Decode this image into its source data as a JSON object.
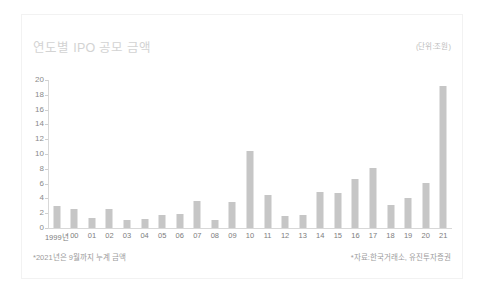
{
  "chart_data": {
    "type": "bar",
    "title": "연도별 IPO 공모 금액",
    "unit_label": "(단위:조원)",
    "xlabel": "",
    "ylabel": "",
    "ylim": [
      0,
      20
    ],
    "ytick_step": 2,
    "yticks": [
      20,
      18,
      16,
      14,
      12,
      10,
      8,
      6,
      4,
      2,
      0
    ],
    "grid": false,
    "legend": "none",
    "bar_color": "#c6c6c6",
    "categories": [
      "1999년",
      "00",
      "01",
      "02",
      "03",
      "04",
      "05",
      "06",
      "07",
      "08",
      "09",
      "10",
      "11",
      "12",
      "13",
      "14",
      "15",
      "16",
      "17",
      "18",
      "19",
      "20",
      "21"
    ],
    "values": [
      3.0,
      2.6,
      1.4,
      2.6,
      1.1,
      1.2,
      1.7,
      1.9,
      3.6,
      1.1,
      3.5,
      10.4,
      4.4,
      1.6,
      1.8,
      4.8,
      4.7,
      6.6,
      8.1,
      3.1,
      4.1,
      6.1,
      19.2
    ],
    "annotations": [
      "*2021년은 9월까지 누계 금액",
      "*자료:한국거래소, 유진투자증권"
    ]
  },
  "footer": {
    "note_left": "*2021년은 9월까지 누계 금액",
    "note_right": "*자료:한국거래소, 유진투자증권"
  },
  "colors": {
    "bar": "#c6c6c6",
    "axis": "#d8d8d8",
    "title": "#d3d3d3",
    "tick_text": "#8a8a8a",
    "note_text": "#9b9b9b",
    "card_border": "#f2f2f2",
    "background": "#ffffff"
  }
}
